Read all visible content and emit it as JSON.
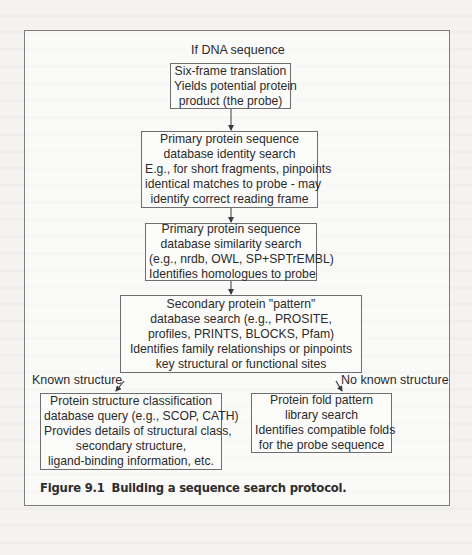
{
  "figure": {
    "caption_number": "Figure 9.1",
    "caption_text": "Building a sequence search protocol."
  },
  "diagram": {
    "start_label": "If DNA sequence",
    "nodes": [
      {
        "id": "six-frame-translation",
        "lines": [
          "Six-frame translation",
          "Yields potential protein",
          "product (the probe)"
        ]
      },
      {
        "id": "primary-identity-search",
        "lines": [
          "Primary protein sequence",
          "database identity search",
          "E.g., for short fragments, pinpoints",
          "identical matches to probe - may",
          "identify correct reading frame"
        ]
      },
      {
        "id": "primary-similarity-search",
        "lines": [
          "Primary protein sequence",
          "database similarity search",
          "(e.g., nrdb, OWL, SP+SPTrEMBL)",
          "Identifies homologues to probe"
        ]
      },
      {
        "id": "secondary-pattern-search",
        "lines": [
          "Secondary protein \"pattern\"",
          "database search (e.g., PROSITE,",
          "profiles, PRINTS, BLOCKS, Pfam)",
          "Identifies family relationships or pinpoints",
          "key structural or functional sites"
        ]
      },
      {
        "id": "structure-classification-query",
        "lines": [
          "Protein structure classification",
          "database query (e.g., SCOP, CATH)",
          "Provides details of structural class,",
          "secondary structure,",
          "ligand-binding information, etc."
        ]
      },
      {
        "id": "fold-pattern-library-search",
        "lines": [
          "Protein fold pattern",
          "library search",
          "Identifies compatible folds",
          "for the probe sequence"
        ]
      }
    ],
    "branch_labels": {
      "left": "Known structure",
      "right": "No known structure"
    },
    "edges": [
      {
        "from": "six-frame-translation",
        "to": "primary-identity-search"
      },
      {
        "from": "primary-identity-search",
        "to": "primary-similarity-search"
      },
      {
        "from": "primary-similarity-search",
        "to": "secondary-pattern-search"
      },
      {
        "from": "secondary-pattern-search",
        "to": "structure-classification-query",
        "label": "Known structure"
      },
      {
        "from": "secondary-pattern-search",
        "to": "fold-pattern-library-search",
        "label": "No known structure"
      }
    ],
    "colors": {
      "line": "#6e6e6e",
      "text": "#2b2b2b",
      "paper": "#f4f3f1"
    }
  }
}
